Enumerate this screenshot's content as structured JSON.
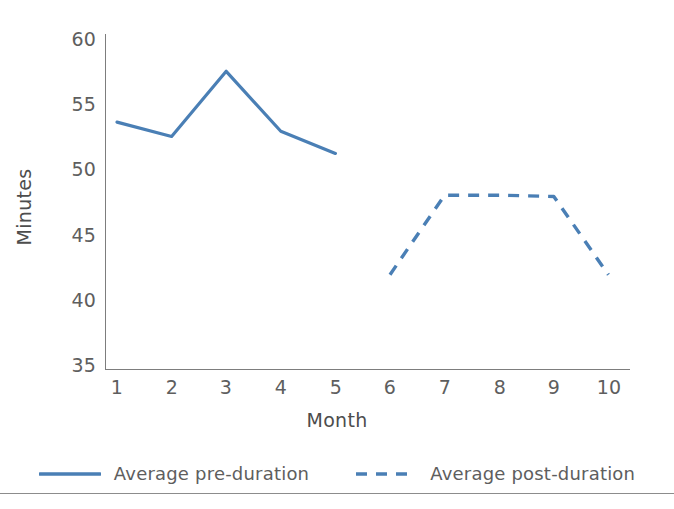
{
  "chart_data": {
    "type": "line",
    "title": "",
    "xlabel": "Month",
    "ylabel": "Minutes",
    "categories": [
      "1",
      "2",
      "3",
      "4",
      "5",
      "6",
      "7",
      "8",
      "9",
      "10"
    ],
    "x": [
      1,
      2,
      3,
      4,
      5,
      6,
      7,
      8,
      9,
      10
    ],
    "xlim": [
      0.6,
      10.4
    ],
    "ylim": [
      35,
      60
    ],
    "yticks": [
      35,
      40,
      45,
      50,
      55,
      60
    ],
    "xticks": [
      1,
      2,
      3,
      4,
      5,
      6,
      7,
      8,
      9,
      10
    ],
    "grid": false,
    "legend_position": "bottom",
    "series": [
      {
        "name": "Average pre-duration",
        "style": "solid",
        "color": "#4a7fb5",
        "x": [
          1,
          2,
          3,
          4,
          5
        ],
        "values": [
          53.7,
          52.6,
          57.6,
          53.0,
          51.3
        ]
      },
      {
        "name": "Average post-duration",
        "style": "dashed",
        "color": "#4a7fb5",
        "x": [
          6,
          7,
          8,
          9,
          10
        ],
        "values": [
          42.0,
          48.1,
          48.1,
          48.0,
          42.0
        ]
      }
    ]
  },
  "axes": {
    "ylabel": "Minutes",
    "xlabel": "Month",
    "ytick_labels": [
      "60",
      "55",
      "50",
      "45",
      "40",
      "35"
    ],
    "xtick_labels": [
      "1",
      "2",
      "3",
      "4",
      "5",
      "6",
      "7",
      "8",
      "9",
      "10"
    ],
    "axis_color": "#7d7d7d",
    "tick_text_color": "#5e5e5e"
  },
  "legend": {
    "items": [
      {
        "label": "Average pre-duration",
        "style": "solid",
        "color": "#4a7fb5"
      },
      {
        "label": "Average post-duration",
        "style": "dashed",
        "color": "#4a7fb5"
      }
    ]
  },
  "theme": {
    "background": "#ffffff",
    "series_blue": "#4a7fb5",
    "rule_color": "#8c8c8c"
  }
}
